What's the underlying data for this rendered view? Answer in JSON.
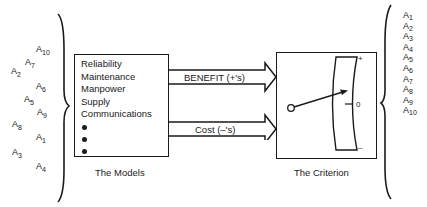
{
  "left_alternatives": [
    {
      "base": "A",
      "sub": "10",
      "x": 36,
      "y": 45
    },
    {
      "base": "A",
      "sub": "7",
      "x": 25,
      "y": 58
    },
    {
      "base": "A",
      "sub": "2",
      "x": 11,
      "y": 67
    },
    {
      "base": "A",
      "sub": "6",
      "x": 36,
      "y": 82
    },
    {
      "base": "A",
      "sub": "5",
      "x": 24,
      "y": 95
    },
    {
      "base": "A",
      "sub": "9",
      "x": 37,
      "y": 108
    },
    {
      "base": "A",
      "sub": "8",
      "x": 12,
      "y": 120
    },
    {
      "base": "A",
      "sub": "1",
      "x": 36,
      "y": 133
    },
    {
      "base": "A",
      "sub": "3",
      "x": 12,
      "y": 148
    },
    {
      "base": "A",
      "sub": "4",
      "x": 36,
      "y": 162
    }
  ],
  "models": {
    "items": [
      "Reliability",
      "Maintenance",
      "Manpower",
      "Supply",
      "Communications"
    ],
    "ellipsis_dots": 3,
    "caption": "The Models"
  },
  "arrows": {
    "benefit_label": "BENEFIT (+'s)",
    "cost_label": "Cost (–'s)"
  },
  "criterion": {
    "caption": "The Criterion",
    "scale_plus": "+",
    "scale_zero": "0",
    "scale_minus": "–"
  },
  "right_alternatives": [
    {
      "base": "A",
      "sub": "1"
    },
    {
      "base": "A",
      "sub": "2"
    },
    {
      "base": "A",
      "sub": "3"
    },
    {
      "base": "A",
      "sub": "4"
    },
    {
      "base": "A",
      "sub": "5"
    },
    {
      "base": "A",
      "sub": "6"
    },
    {
      "base": "A",
      "sub": "7"
    },
    {
      "base": "A",
      "sub": "8"
    },
    {
      "base": "A",
      "sub": "9"
    },
    {
      "base": "A",
      "sub": "10"
    }
  ]
}
